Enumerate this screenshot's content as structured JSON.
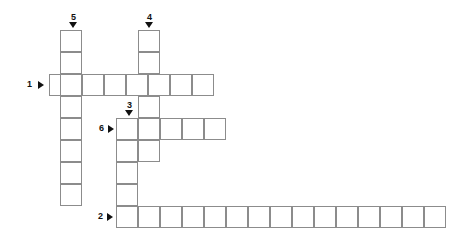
{
  "puzzle": {
    "title": "Crossword grid",
    "cell_size": 22,
    "grid_color": "#8c8c8c",
    "background": "#ffffff",
    "marker_color": "#111111",
    "clues": [
      {
        "number": "1",
        "direction": "across",
        "label_x": 27,
        "label_y": 80,
        "arrow_x": 38,
        "arrow_y": 81,
        "length": 8
      },
      {
        "number": "2",
        "direction": "across",
        "label_x": 98,
        "label_y": 212,
        "arrow_x": 107,
        "arrow_y": 213,
        "length": 15
      },
      {
        "number": "3",
        "direction": "down",
        "label_x": 127,
        "label_y": 101,
        "arrow_x": 125,
        "arrow_y": 110,
        "length": 5
      },
      {
        "number": "4",
        "direction": "down",
        "label_x": 147,
        "label_y": 13,
        "arrow_x": 145,
        "arrow_y": 22,
        "length": 6
      },
      {
        "number": "5",
        "direction": "down",
        "label_x": 71,
        "label_y": 13,
        "arrow_x": 69,
        "arrow_y": 22,
        "length": 8
      },
      {
        "number": "6",
        "direction": "across",
        "label_x": 99,
        "label_y": 124,
        "arrow_x": 108,
        "arrow_y": 125,
        "length": 5
      }
    ],
    "cells": [
      {
        "x": 60,
        "y": 30
      },
      {
        "x": 60,
        "y": 52
      },
      {
        "x": 138,
        "y": 30
      },
      {
        "x": 138,
        "y": 52
      },
      {
        "x": 49,
        "y": 74
      },
      {
        "x": 60,
        "y": 74
      },
      {
        "x": 82,
        "y": 74
      },
      {
        "x": 104,
        "y": 74
      },
      {
        "x": 126,
        "y": 74
      },
      {
        "x": 148,
        "y": 74
      },
      {
        "x": 170,
        "y": 74
      },
      {
        "x": 192,
        "y": 74
      },
      {
        "x": 60,
        "y": 96
      },
      {
        "x": 138,
        "y": 96
      },
      {
        "x": 60,
        "y": 118
      },
      {
        "x": 116,
        "y": 118
      },
      {
        "x": 138,
        "y": 118
      },
      {
        "x": 160,
        "y": 118
      },
      {
        "x": 182,
        "y": 118
      },
      {
        "x": 204,
        "y": 118
      },
      {
        "x": 60,
        "y": 140
      },
      {
        "x": 116,
        "y": 140
      },
      {
        "x": 138,
        "y": 140
      },
      {
        "x": 60,
        "y": 162
      },
      {
        "x": 116,
        "y": 162
      },
      {
        "x": 60,
        "y": 184
      },
      {
        "x": 116,
        "y": 184
      },
      {
        "x": 116,
        "y": 206
      },
      {
        "x": 138,
        "y": 206
      },
      {
        "x": 160,
        "y": 206
      },
      {
        "x": 182,
        "y": 206
      },
      {
        "x": 204,
        "y": 206
      },
      {
        "x": 226,
        "y": 206
      },
      {
        "x": 248,
        "y": 206
      },
      {
        "x": 270,
        "y": 206
      },
      {
        "x": 292,
        "y": 206
      },
      {
        "x": 314,
        "y": 206
      },
      {
        "x": 336,
        "y": 206
      },
      {
        "x": 358,
        "y": 206
      },
      {
        "x": 380,
        "y": 206
      },
      {
        "x": 402,
        "y": 206
      },
      {
        "x": 424,
        "y": 206
      }
    ]
  }
}
